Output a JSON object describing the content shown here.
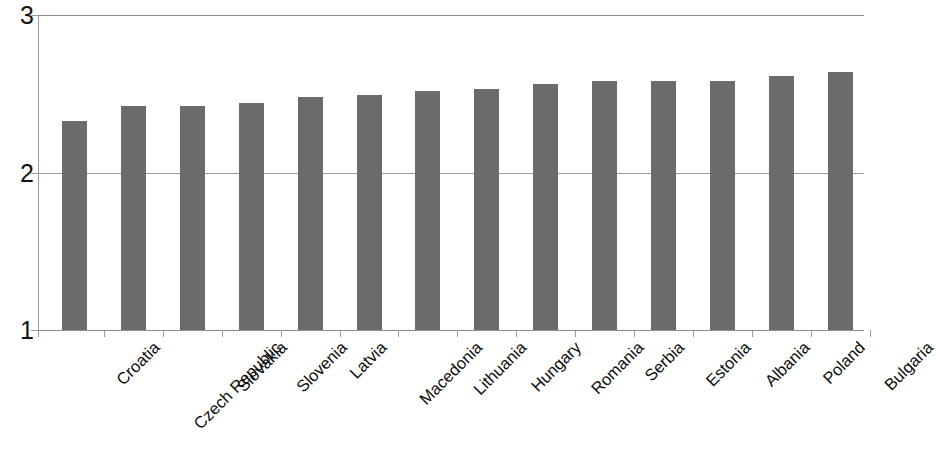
{
  "chart_data": {
    "type": "bar",
    "title": "",
    "subtitle": "",
    "xlabel": "",
    "ylabel": "",
    "ylim": [
      1,
      3
    ],
    "ytick_labels": [
      "3",
      "2",
      "1"
    ],
    "ytick_values": [
      3,
      2,
      1
    ],
    "grid": true,
    "legend": null,
    "legend_position": "none",
    "bar_color": "#6b6b6b",
    "axis_color": "#9a9a9a",
    "label_color": "#111111",
    "label_rotation": -45,
    "categories": [
      "Croatia",
      "Czech Republic",
      "Slovakia",
      "Slovenia",
      "Latvia",
      "Macedonia",
      "Lithuania",
      "Hungary",
      "Romania",
      "Serbia",
      "Estonia",
      "Albania",
      "Poland",
      "Bulgaria"
    ],
    "values": [
      2.33,
      2.42,
      2.42,
      2.44,
      2.48,
      2.49,
      2.52,
      2.53,
      2.56,
      2.58,
      2.58,
      2.58,
      2.61,
      2.64
    ]
  }
}
